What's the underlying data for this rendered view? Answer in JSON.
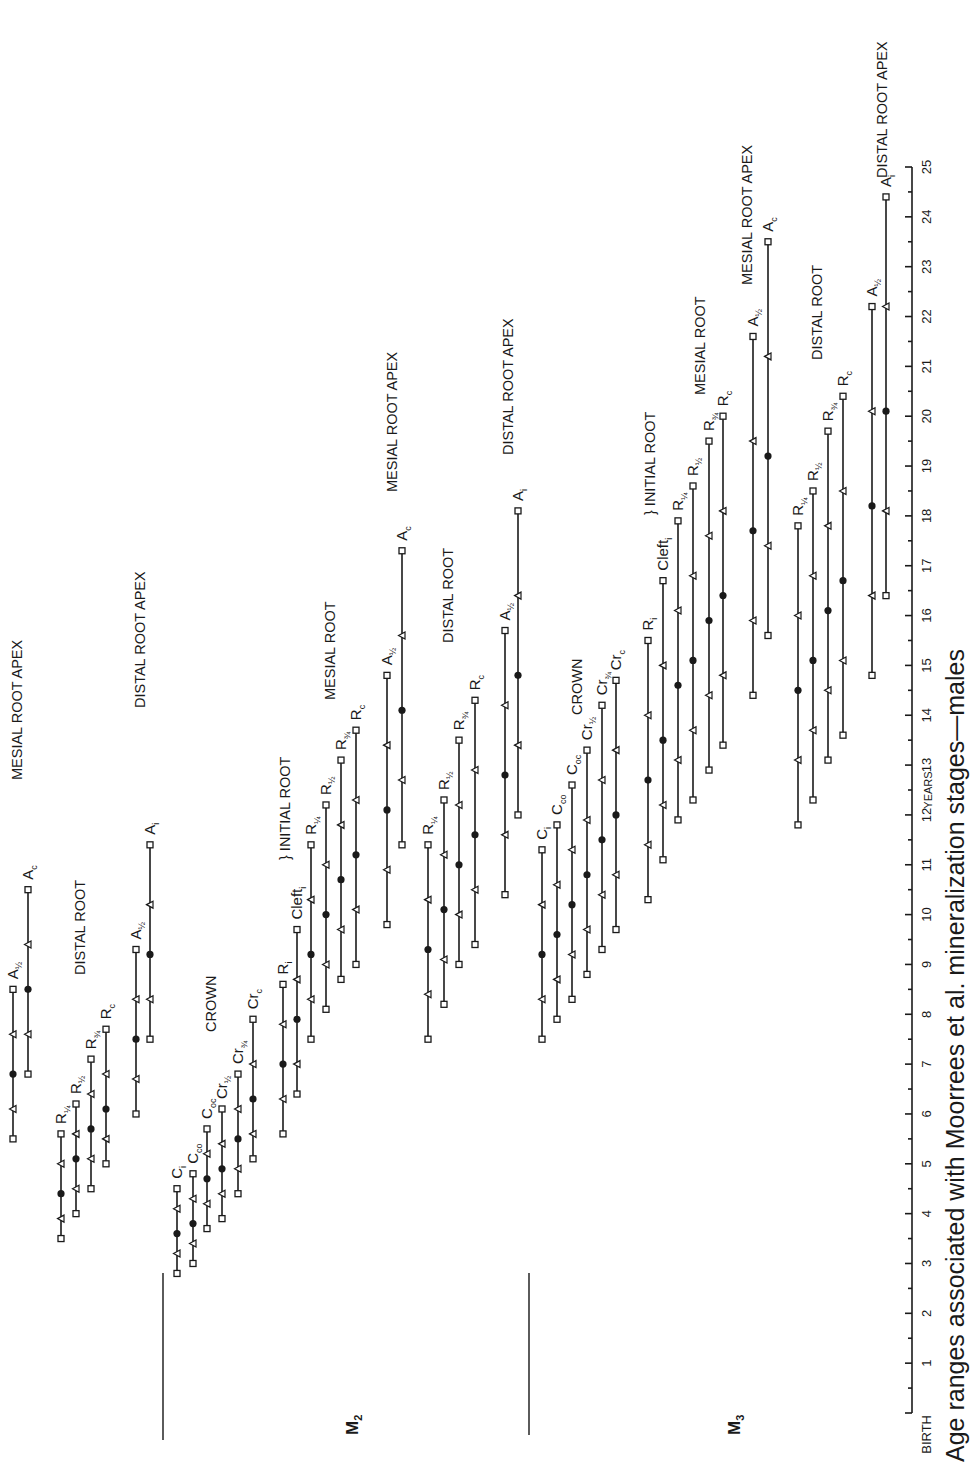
{
  "chart_data": {
    "type": "range-bar",
    "orientation": "rotated-90ccw",
    "title": "Age ranges associated with Moorrees et al. mineralization stages—males",
    "xlabel": "YEARS",
    "x_ticks": [
      "BIRTH",
      "1",
      "2",
      "3",
      "4",
      "5",
      "6",
      "7",
      "8",
      "9",
      "10",
      "11",
      "12",
      "13",
      "14",
      "15",
      "16",
      "17",
      "18",
      "19",
      "20",
      "21",
      "22",
      "23",
      "24",
      "25"
    ],
    "x_range": [
      0,
      25
    ],
    "marker_legend": {
      "square": "range end (min / max)",
      "triangle": "inner range bound",
      "dot": "mean"
    },
    "groups": [
      {
        "tooth": "",
        "label": "preceding tooth (partially shown)",
        "bars": [
          {
            "stage": "A½",
            "x": 13,
            "values": [
              5.5,
              6.1,
              6.8,
              7.6,
              8.5
            ]
          },
          {
            "stage": "Ac",
            "x": 28,
            "values": [
              6.8,
              7.6,
              8.5,
              9.4,
              10.5
            ]
          },
          {
            "stage": "R¼",
            "x": 61,
            "values": [
              3.5,
              3.9,
              4.4,
              5.0,
              5.6
            ]
          },
          {
            "stage": "R½",
            "x": 76,
            "values": [
              4.0,
              4.5,
              5.1,
              5.6,
              6.2
            ]
          },
          {
            "stage": "R¾",
            "x": 91,
            "values": [
              4.5,
              5.1,
              5.7,
              6.4,
              7.1
            ]
          },
          {
            "stage": "Rc",
            "x": 106,
            "values": [
              5.0,
              5.5,
              6.1,
              6.8,
              7.7
            ]
          },
          {
            "stage": "A½",
            "x": 136,
            "values": [
              6.0,
              6.7,
              7.5,
              8.3,
              9.3
            ]
          },
          {
            "stage": "Ai",
            "x": 150,
            "values": [
              7.5,
              8.3,
              9.2,
              10.2,
              11.4
            ]
          }
        ]
      },
      {
        "tooth": "M2",
        "bars": [
          {
            "stage": "Ci",
            "x": 177,
            "values": [
              2.8,
              3.2,
              3.6,
              4.1,
              4.5
            ]
          },
          {
            "stage": "Cco",
            "x": 193,
            "values": [
              3.0,
              3.4,
              3.8,
              4.3,
              4.8
            ]
          },
          {
            "stage": "Coc",
            "x": 207,
            "values": [
              3.7,
              4.2,
              4.7,
              5.2,
              5.7
            ]
          },
          {
            "stage": "Cr½",
            "x": 222,
            "values": [
              3.9,
              4.4,
              4.9,
              5.4,
              6.1
            ]
          },
          {
            "stage": "Cr¾",
            "x": 238,
            "values": [
              4.4,
              4.9,
              5.5,
              6.1,
              6.8
            ]
          },
          {
            "stage": "Crc",
            "x": 253,
            "values": [
              5.1,
              5.6,
              6.3,
              7.0,
              7.9
            ]
          },
          {
            "stage": "Ri",
            "x": 283,
            "values": [
              5.6,
              6.3,
              7.0,
              7.8,
              8.6
            ]
          },
          {
            "stage": "Cleft i",
            "x": 297,
            "values": [
              6.4,
              7.0,
              7.9,
              8.7,
              9.7
            ]
          },
          {
            "stage": "R¼",
            "x": 311,
            "values": [
              7.5,
              8.3,
              9.2,
              10.3,
              11.4
            ]
          },
          {
            "stage": "R½",
            "x": 326,
            "values": [
              8.1,
              9.0,
              10.0,
              11.0,
              12.2
            ]
          },
          {
            "stage": "R¾",
            "x": 341,
            "values": [
              8.7,
              9.7,
              10.7,
              11.8,
              13.1
            ]
          },
          {
            "stage": "Rc",
            "x": 356,
            "values": [
              9.0,
              10.1,
              11.2,
              12.3,
              13.7
            ]
          },
          {
            "stage": "A½",
            "x": 387,
            "values": [
              9.8,
              10.9,
              12.1,
              13.4,
              14.8
            ]
          },
          {
            "stage": "Ac",
            "x": 402,
            "values": [
              11.4,
              12.7,
              14.1,
              15.6,
              17.3
            ]
          },
          {
            "stage": "R¼ (distal)",
            "x": 428,
            "values": [
              7.5,
              8.4,
              9.3,
              10.3,
              11.4
            ]
          },
          {
            "stage": "R½ (distal)",
            "x": 444,
            "values": [
              8.2,
              9.1,
              10.1,
              11.2,
              12.3
            ]
          },
          {
            "stage": "R¾ (distal)",
            "x": 459,
            "values": [
              9.0,
              10.0,
              11.0,
              12.2,
              13.5
            ]
          },
          {
            "stage": "Rc (distal)",
            "x": 475,
            "values": [
              9.4,
              10.5,
              11.6,
              12.9,
              14.3
            ]
          },
          {
            "stage": "A½ (distal)",
            "x": 505,
            "values": [
              10.4,
              11.6,
              12.8,
              14.2,
              15.7
            ]
          },
          {
            "stage": "Ai (distal)",
            "x": 518,
            "values": [
              12.0,
              13.4,
              14.8,
              16.4,
              18.1
            ]
          }
        ]
      },
      {
        "tooth": "M3",
        "bars": [
          {
            "stage": "Ci",
            "x": 542,
            "values": [
              7.5,
              8.3,
              9.2,
              10.2,
              11.3
            ]
          },
          {
            "stage": "Cco",
            "x": 557,
            "values": [
              7.9,
              8.7,
              9.6,
              10.6,
              11.8
            ]
          },
          {
            "stage": "Coc",
            "x": 572,
            "values": [
              8.3,
              9.2,
              10.2,
              11.3,
              12.6
            ]
          },
          {
            "stage": "Cr½",
            "x": 587,
            "values": [
              8.8,
              9.7,
              10.8,
              11.9,
              13.3
            ]
          },
          {
            "stage": "Cr¾",
            "x": 602,
            "values": [
              9.3,
              10.4,
              11.5,
              12.7,
              14.2
            ]
          },
          {
            "stage": "Crc",
            "x": 616,
            "values": [
              9.7,
              10.8,
              12.0,
              13.3,
              14.7
            ]
          },
          {
            "stage": "Ri",
            "x": 648,
            "values": [
              10.3,
              11.4,
              12.7,
              14.0,
              15.5
            ]
          },
          {
            "stage": "Cleft i",
            "x": 663,
            "values": [
              11.1,
              12.2,
              13.5,
              15.0,
              16.7
            ]
          },
          {
            "stage": "R¼",
            "x": 678,
            "values": [
              11.9,
              13.1,
              14.6,
              16.1,
              17.9
            ]
          },
          {
            "stage": "R½",
            "x": 693,
            "values": [
              12.3,
              13.7,
              15.1,
              16.8,
              18.6
            ]
          },
          {
            "stage": "R¾",
            "x": 709,
            "values": [
              12.9,
              14.4,
              15.9,
              17.6,
              19.5
            ]
          },
          {
            "stage": "Rc",
            "x": 723,
            "values": [
              13.4,
              14.8,
              16.4,
              18.1,
              20.0
            ]
          },
          {
            "stage": "A½",
            "x": 753,
            "values": [
              14.4,
              15.9,
              17.7,
              19.5,
              21.6
            ]
          },
          {
            "stage": "Ac",
            "x": 768,
            "values": [
              15.6,
              17.4,
              19.2,
              21.2,
              23.5
            ]
          },
          {
            "stage": "R¼ (distal)",
            "x": 798,
            "values": [
              11.8,
              13.1,
              14.5,
              16.0,
              17.8
            ]
          },
          {
            "stage": "R½ (distal)",
            "x": 813,
            "values": [
              12.3,
              13.7,
              15.1,
              16.8,
              18.5
            ]
          },
          {
            "stage": "R¾ (distal)",
            "x": 828,
            "values": [
              13.1,
              14.5,
              16.1,
              17.8,
              19.7
            ]
          },
          {
            "stage": "Rc (distal)",
            "x": 843,
            "values": [
              13.6,
              15.1,
              16.7,
              18.5,
              20.4
            ]
          },
          {
            "stage": "A½ (distal)",
            "x": 872,
            "values": [
              14.8,
              16.4,
              18.2,
              20.1,
              22.2
            ]
          },
          {
            "stage": "Ai (distal)",
            "x": 886,
            "values": [
              16.4,
              18.1,
              20.1,
              22.2,
              24.4
            ]
          }
        ]
      }
    ],
    "stage_labels": [
      {
        "base": "A",
        "sub": "½",
        "x": 13,
        "age": 8.5
      },
      {
        "base": "A",
        "sub": "c",
        "x": 28,
        "age": 10.5
      },
      {
        "base": "R",
        "sub": "¼",
        "x": 61,
        "age": 5.6
      },
      {
        "base": "R",
        "sub": "½",
        "x": 76,
        "age": 6.2
      },
      {
        "base": "R",
        "sub": "¾",
        "x": 91,
        "age": 7.1
      },
      {
        "base": "R",
        "sub": "c",
        "x": 106,
        "age": 7.7
      },
      {
        "base": "A",
        "sub": "½",
        "x": 136,
        "age": 9.3
      },
      {
        "base": "A",
        "sub": "i",
        "x": 150,
        "age": 11.4
      },
      {
        "base": "C",
        "sub": "i",
        "x": 177,
        "age": 4.5
      },
      {
        "base": "C",
        "sub": "co",
        "x": 193,
        "age": 4.8
      },
      {
        "base": "C",
        "sub": "oc",
        "x": 207,
        "age": 5.7
      },
      {
        "base": "Cr",
        "sub": "½",
        "x": 222,
        "age": 6.1
      },
      {
        "base": "Cr",
        "sub": "¾",
        "x": 238,
        "age": 6.8
      },
      {
        "base": "Cr",
        "sub": "c",
        "x": 253,
        "age": 7.9
      },
      {
        "base": "R",
        "sub": "i",
        "x": 283,
        "age": 8.6
      },
      {
        "base": "Cleft",
        "sub": "i",
        "x": 297,
        "age": 9.7
      },
      {
        "base": "R",
        "sub": "¼",
        "x": 311,
        "age": 11.4
      },
      {
        "base": "R",
        "sub": "½",
        "x": 326,
        "age": 12.2
      },
      {
        "base": "R",
        "sub": "¾",
        "x": 341,
        "age": 13.1
      },
      {
        "base": "R",
        "sub": "c",
        "x": 356,
        "age": 13.7
      },
      {
        "base": "A",
        "sub": "½",
        "x": 387,
        "age": 14.8
      },
      {
        "base": "A",
        "sub": "c",
        "x": 402,
        "age": 17.3
      },
      {
        "base": "R",
        "sub": "¼",
        "x": 428,
        "age": 11.4
      },
      {
        "base": "R",
        "sub": "½",
        "x": 444,
        "age": 12.3
      },
      {
        "base": "R",
        "sub": "¾",
        "x": 459,
        "age": 13.5
      },
      {
        "base": "R",
        "sub": "c",
        "x": 475,
        "age": 14.3
      },
      {
        "base": "A",
        "sub": "½",
        "x": 505,
        "age": 15.7
      },
      {
        "base": "A",
        "sub": "i",
        "x": 518,
        "age": 18.1
      },
      {
        "base": "C",
        "sub": "i",
        "x": 542,
        "age": 11.3
      },
      {
        "base": "C",
        "sub": "co",
        "x": 557,
        "age": 11.8
      },
      {
        "base": "C",
        "sub": "oc",
        "x": 572,
        "age": 12.6
      },
      {
        "base": "Cr",
        "sub": "½",
        "x": 587,
        "age": 13.3
      },
      {
        "base": "Cr",
        "sub": "¾",
        "x": 602,
        "age": 14.2
      },
      {
        "base": "Cr",
        "sub": "c",
        "x": 616,
        "age": 14.7
      },
      {
        "base": "R",
        "sub": "i",
        "x": 648,
        "age": 15.5
      },
      {
        "base": "Cleft",
        "sub": "i",
        "x": 663,
        "age": 16.7
      },
      {
        "base": "R",
        "sub": "¼",
        "x": 678,
        "age": 17.9
      },
      {
        "base": "R",
        "sub": "½",
        "x": 693,
        "age": 18.6
      },
      {
        "base": "R",
        "sub": "¾",
        "x": 709,
        "age": 19.5
      },
      {
        "base": "R",
        "sub": "c",
        "x": 723,
        "age": 20.0
      },
      {
        "base": "A",
        "sub": "½",
        "x": 753,
        "age": 21.6
      },
      {
        "base": "A",
        "sub": "c",
        "x": 768,
        "age": 23.5
      },
      {
        "base": "R",
        "sub": "¼",
        "x": 798,
        "age": 17.8
      },
      {
        "base": "R",
        "sub": "½",
        "x": 813,
        "age": 18.5
      },
      {
        "base": "R",
        "sub": "¾",
        "x": 828,
        "age": 19.7
      },
      {
        "base": "R",
        "sub": "c",
        "x": 843,
        "age": 20.4
      },
      {
        "base": "A",
        "sub": "½",
        "x": 872,
        "age": 22.2
      },
      {
        "base": "A",
        "sub": "i",
        "x": 886,
        "age": 24.4
      }
    ],
    "group_labels": [
      {
        "text": "MESIAL ROOT APEX",
        "x": 22,
        "y": 780
      },
      {
        "text": "DISTAL ROOT",
        "x": 85,
        "y": 975
      },
      {
        "text": "DISTAL ROOT APEX",
        "x": 145,
        "y": 708
      },
      {
        "text": "CROWN",
        "x": 216,
        "y": 1032
      },
      {
        "text": "}  INITIAL ROOT",
        "x": 290,
        "y": 860
      },
      {
        "text": "MESIAL ROOT",
        "x": 335,
        "y": 700
      },
      {
        "text": "MESIAL ROOT APEX",
        "x": 397,
        "y": 492
      },
      {
        "text": "DISTAL ROOT",
        "x": 453,
        "y": 643
      },
      {
        "text": "DISTAL ROOT APEX",
        "x": 513,
        "y": 455
      },
      {
        "text": "CROWN",
        "x": 582,
        "y": 715
      },
      {
        "text": "}  INITIAL ROOT",
        "x": 655,
        "y": 515
      },
      {
        "text": "MESIAL ROOT",
        "x": 705,
        "y": 395
      },
      {
        "text": "MESIAL ROOT APEX",
        "x": 752,
        "y": 285
      },
      {
        "text": "DISTAL ROOT",
        "x": 822,
        "y": 360
      },
      {
        "text": "DISTAL ROOT APEX",
        "x": 887,
        "y": 178
      }
    ],
    "tooth_labels": [
      {
        "base": "M",
        "sub": "2",
        "x": 358,
        "y": 1435
      },
      {
        "base": "M",
        "sub": "3",
        "x": 740,
        "y": 1435
      }
    ]
  }
}
